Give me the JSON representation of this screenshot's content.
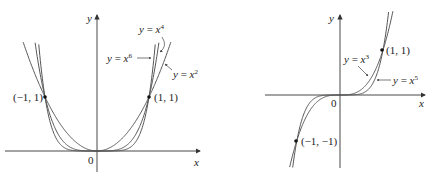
{
  "chart_data": [
    {
      "type": "line",
      "panel": "left",
      "title": "",
      "xlabel": "x",
      "ylabel": "y",
      "origin_label": "0",
      "series": [
        {
          "name": "y = x^2",
          "label": "y = x",
          "exponent": "2",
          "function": "x^2"
        },
        {
          "name": "y = x^4",
          "label": "y = x",
          "exponent": "4",
          "function": "x^4"
        },
        {
          "name": "y = x^6",
          "label": "y = x",
          "exponent": "6",
          "function": "x^6"
        }
      ],
      "points": [
        {
          "x": -1,
          "y": 1,
          "label": "(−1, 1)"
        },
        {
          "x": 1,
          "y": 1,
          "label": "(1, 1)"
        }
      ],
      "xlim": [
        -1.8,
        1.8
      ],
      "ylim": [
        -0.3,
        1.9
      ],
      "grid": false
    },
    {
      "type": "line",
      "panel": "right",
      "title": "",
      "xlabel": "x",
      "ylabel": "y",
      "origin_label": "0",
      "series": [
        {
          "name": "y = x^3",
          "label": "y = x",
          "exponent": "3",
          "function": "x^3"
        },
        {
          "name": "y = x^5",
          "label": "y = x",
          "exponent": "5",
          "function": "x^5"
        }
      ],
      "points": [
        {
          "x": 1,
          "y": 1,
          "label": "(1, 1)"
        },
        {
          "x": -1,
          "y": -1,
          "label": "(−1, −1)"
        }
      ],
      "xlim": [
        -1.6,
        1.6
      ],
      "ylim": [
        -1.6,
        1.6
      ],
      "grid": false
    }
  ]
}
